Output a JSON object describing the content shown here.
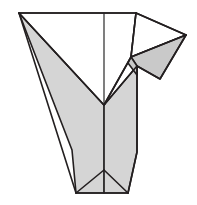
{
  "figure": {
    "title": "Origami fold step diagram",
    "kind": "line-diagram",
    "caption": "",
    "canvas": {
      "width": 197,
      "height": 205,
      "background": "#ffffff"
    },
    "palette": {
      "shaded_fill": "#d5d5d5",
      "shaded_fill_dark": "#c9c9c9",
      "white_fill": "#ffffff",
      "outline": "#231f20",
      "crease": "#3a3a3a"
    },
    "labels": {
      "left_wing": "left-shaded-wing",
      "right_wing": "right-shaded-wing",
      "top_white_panel": "top-white-panel",
      "right_white_flap": "right-white-flap",
      "right_gray_flap": "right-gray-flap",
      "center_crease": "center-vertical-crease",
      "bottom_notch": "bottom-notch"
    },
    "geometry": {
      "top_left_vertex": [
        19,
        13
      ],
      "top_right_vertex": [
        136,
        13
      ],
      "right_point_vertex": [
        186,
        35
      ],
      "center_top": [
        104,
        13
      ],
      "center_v_junction": [
        104,
        105
      ],
      "center_bottom": [
        104,
        193
      ],
      "bottom_left": [
        76,
        193
      ],
      "bottom_right": [
        128,
        193
      ],
      "right_flap_notch": [
        131,
        57
      ],
      "right_flap_corner": [
        137,
        66
      ],
      "right_gray_tip": [
        160,
        79
      ]
    },
    "paths": {
      "left_shaded_wing": "M 19,13 L 104,105 L 104,193 L 76,193 Z",
      "right_shaded_wing": "M 137,66 L 137,152 L 128,193 L 104,193 L 104,105 Z",
      "top_white_panel": "M 19,13 L 136,13 L 131,57 L 104,105 Z",
      "right_white_flap": "M 136,13 L 186,35 L 131,57 Z",
      "right_gray_flap": "M 131,57 L 186,35 L 160,79 L 137,66 Z",
      "center_crease": "M 104,13 L 104,193",
      "bottom_notch_left": "M 76,193 L 104,170",
      "bottom_notch_right": "M 128,193 L 104,170"
    }
  }
}
